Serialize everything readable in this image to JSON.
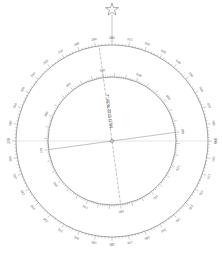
{
  "diagram": {
    "type": "compass-rose",
    "center": [
      112,
      141
    ],
    "true_north_star": {
      "icon": "star-icon",
      "position": [
        112,
        10
      ]
    },
    "declination_label": "7° 45'W 2015 (1'W)",
    "declination_degrees": -7.75,
    "outer_ring": {
      "name": "true",
      "radius": 96,
      "label_step": 10,
      "labels": [
        "000",
        "010",
        "020",
        "030",
        "040",
        "050",
        "060",
        "070",
        "080",
        "090",
        "100",
        "110",
        "120",
        "130",
        "140",
        "150",
        "160",
        "170",
        "180",
        "190",
        "200",
        "210",
        "220",
        "230",
        "240",
        "250",
        "260",
        "270",
        "280",
        "290",
        "300",
        "310",
        "320",
        "330",
        "340",
        "350"
      ]
    },
    "inner_ring": {
      "name": "magnetic",
      "radius": 64,
      "label_step": 30,
      "labels": [
        "000",
        "030",
        "060",
        "090",
        "120",
        "150",
        "180",
        "210",
        "240",
        "270",
        "300",
        "330"
      ]
    },
    "colors": {
      "ring": "#8a8a8a",
      "tick": "#666666",
      "label": "#555555",
      "crosshair": "#bbbbbb",
      "magnetic_line": "#777777"
    }
  }
}
